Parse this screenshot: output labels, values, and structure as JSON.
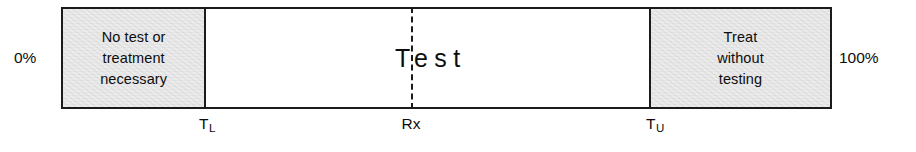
{
  "diagram": {
    "scale": {
      "start_label": "0%",
      "end_label": "100%"
    },
    "zones": [
      {
        "id": "no-test-zone",
        "label": "No test or\ntreatment\nnecessary",
        "shaded": true,
        "width_px": 144
      },
      {
        "id": "test-zone",
        "label": "Test",
        "shaded": false,
        "width_px": 447
      },
      {
        "id": "treat-zone",
        "label": "Treat\nwithout\ntesting",
        "shaded": true,
        "width_px": 180
      }
    ],
    "markers": [
      {
        "id": "lower-threshold",
        "label": "T",
        "sub": "L",
        "x_px": 207
      },
      {
        "id": "rx-marker",
        "label": "Rx",
        "sub": "",
        "x_px": 411
      },
      {
        "id": "upper-threshold",
        "label": "T",
        "sub": "U",
        "x_px": 655
      }
    ],
    "colors": {
      "line": "#1b1b1b",
      "shading": "#d9d9d9",
      "background": "#ffffff",
      "text": "#0d0d0d"
    }
  }
}
